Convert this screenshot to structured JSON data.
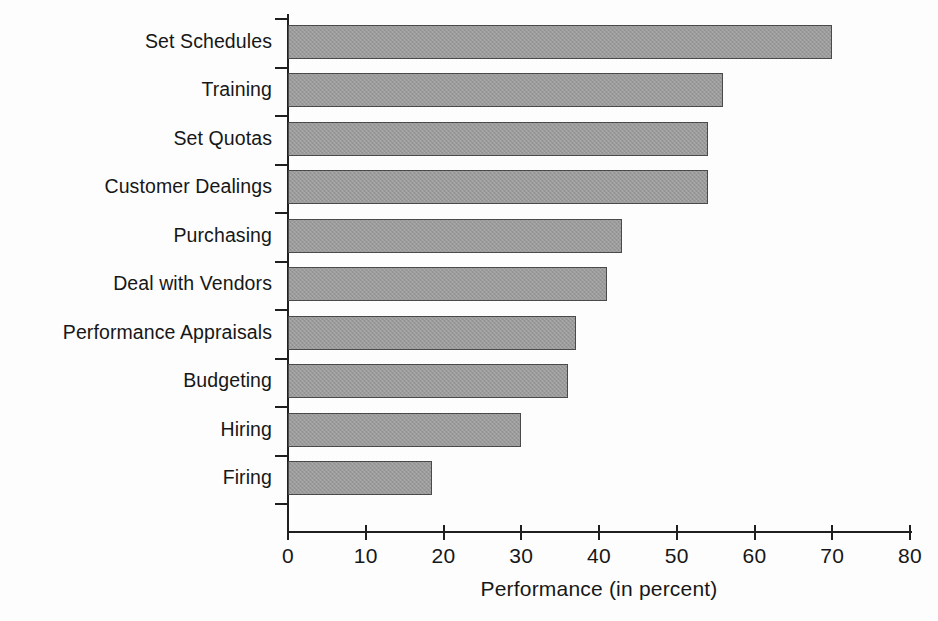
{
  "chart_data": {
    "type": "bar",
    "orientation": "horizontal",
    "title": "",
    "xlabel": "Performance (in percent)",
    "ylabel": "",
    "xlim": [
      0,
      80
    ],
    "xticks": [
      0,
      10,
      20,
      30,
      40,
      50,
      60,
      70,
      80
    ],
    "grid": false,
    "legend": false,
    "categories": [
      "Set Schedules",
      "Training",
      "Set Quotas",
      "Customer Dealings",
      "Purchasing",
      "Deal with Vendors",
      "Performance Appraisals",
      "Budgeting",
      "Hiring",
      "Firing"
    ],
    "values": [
      70,
      56,
      54,
      54,
      43,
      41,
      37,
      36,
      30,
      18.5
    ],
    "bar_color": "#9b9b9b",
    "bar_edge_color": "#4a4a4a",
    "axis_color": "#1f1f1f",
    "background_color": "#fdfdfd"
  }
}
